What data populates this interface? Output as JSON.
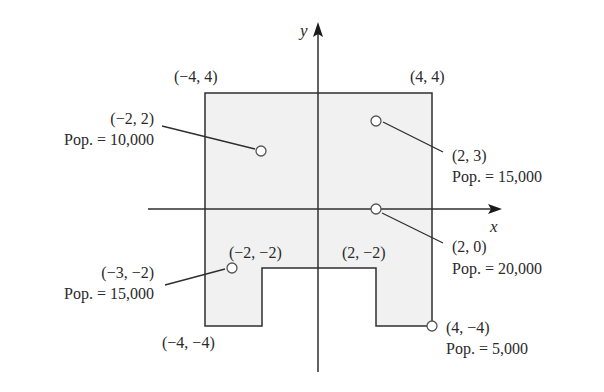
{
  "diagram": {
    "colors": {
      "region_fill": "#f1f1f1",
      "stroke": "#2f2f2f",
      "text": "#2a2a2a",
      "point_stroke": "#555555"
    },
    "axes": {
      "x_label": "x",
      "y_label": "y"
    },
    "region_vertices": [
      {
        "x": -4,
        "y": 4
      },
      {
        "x": 4,
        "y": 4
      },
      {
        "x": 4,
        "y": -4
      },
      {
        "x": 2,
        "y": -4
      },
      {
        "x": 2,
        "y": -2
      },
      {
        "x": -2,
        "y": -2
      },
      {
        "x": -2,
        "y": -4
      },
      {
        "x": -4,
        "y": -4
      }
    ],
    "corner_labels": {
      "top_left": "(−4, 4)",
      "top_right": "(4, 4)",
      "notch_left": "(−2, −2)",
      "notch_right": "(2, −2)",
      "bottom_left": "(−4, −4)"
    },
    "points": [
      {
        "coord": "(−2, 2)",
        "pop": "Pop. = 10,000",
        "x": -2,
        "y": 2,
        "population": 10000
      },
      {
        "coord": "(2, 3)",
        "pop": "Pop. = 15,000",
        "x": 2,
        "y": 3,
        "population": 15000
      },
      {
        "coord": "(2, 0)",
        "pop": "Pop. = 20,000",
        "x": 2,
        "y": 0,
        "population": 20000
      },
      {
        "coord": "(−3, −2)",
        "pop": "Pop. = 15,000",
        "x": -3,
        "y": -2,
        "population": 15000
      },
      {
        "coord": "(4, −4)",
        "pop": "Pop. = 5,000",
        "x": 4,
        "y": -4,
        "population": 5000
      }
    ]
  }
}
